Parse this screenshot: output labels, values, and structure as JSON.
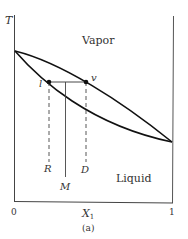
{
  "diagram": {
    "axis_y_label": "T",
    "axis_x_label_main": "X",
    "axis_x_label_sub": "1",
    "x_tick_min": "0",
    "x_tick_max": "1",
    "region_upper": "Vapor",
    "region_lower": "Liquid",
    "point_liquid": "l",
    "point_vapor": "v",
    "marker_r": "R",
    "marker_m": "M",
    "marker_d": "D",
    "caption": "(a)",
    "colors": {
      "line": "#111111",
      "axis": "#444444",
      "text": "#333333",
      "background": "#ffffff"
    }
  }
}
